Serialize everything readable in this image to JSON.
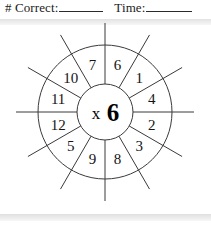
{
  "header": {
    "correct_label": "# Correct:",
    "correct_value": "",
    "time_label": "Time:",
    "time_value": ""
  },
  "wheel": {
    "center_operator": "x",
    "center_factor": "6",
    "center_label": "x6",
    "sectors": [
      {
        "label": "6",
        "angle_deg": 15
      },
      {
        "label": "1",
        "angle_deg": 45
      },
      {
        "label": "4",
        "angle_deg": 75
      },
      {
        "label": "2",
        "angle_deg": 105
      },
      {
        "label": "3",
        "angle_deg": 135
      },
      {
        "label": "8",
        "angle_deg": 165
      },
      {
        "label": "9",
        "angle_deg": 195
      },
      {
        "label": "5",
        "angle_deg": 225
      },
      {
        "label": "12",
        "angle_deg": 255
      },
      {
        "label": "11",
        "angle_deg": 285
      },
      {
        "label": "10",
        "angle_deg": 315
      },
      {
        "label": "7",
        "angle_deg": 345
      }
    ],
    "geometry": {
      "center_x": 105,
      "center_y": 90,
      "inner_radius": 28,
      "outer_radius": 67,
      "spoke_overhang": 22,
      "spoke_count": 12
    },
    "colors": {
      "line": "#3a3a3a",
      "text": "#141414",
      "background": "#ffffff",
      "rule": "#e6e6e6"
    }
  }
}
